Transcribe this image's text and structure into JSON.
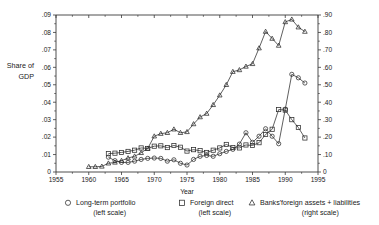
{
  "chart_data": {
    "type": "line",
    "title": "",
    "xlabel": "Year",
    "ylabel": "Share of GDP",
    "ylabel_line1": "Share of",
    "ylabel_line2": "GDP",
    "xlim": [
      1955,
      1995
    ],
    "xticks": [
      1955,
      1960,
      1965,
      1970,
      1975,
      1980,
      1985,
      1990,
      1995
    ],
    "xticklabels": [
      "1955",
      "1960",
      "1965",
      "1970",
      "1975",
      "1980",
      "1985",
      "1990",
      "1995"
    ],
    "ylim_left": [
      0,
      0.09
    ],
    "yticks_left": [
      0,
      0.01,
      0.02,
      0.03,
      0.04,
      0.05,
      0.06,
      0.07,
      0.08,
      0.09
    ],
    "yticklabels_left": [
      "0",
      ".01",
      ".02",
      ".03",
      ".04",
      ".05",
      ".06",
      ".07",
      ".08",
      ".09"
    ],
    "ylim_right": [
      0,
      90
    ],
    "yticks_right": [
      0,
      10,
      20,
      30,
      40,
      50,
      60,
      70,
      80,
      90
    ],
    "yticklabels_right": [
      "0",
      ".10",
      ".20",
      ".30",
      ".40",
      ".50",
      ".60",
      ".70",
      ".80",
      ".90"
    ],
    "grid": false,
    "legend_position": "below",
    "series": [
      {
        "name": "Long-term portfolio",
        "scale": "left",
        "marker": "circle",
        "x": [
          1963,
          1964,
          1965,
          1966,
          1967,
          1968,
          1969,
          1970,
          1971,
          1972,
          1973,
          1974,
          1975,
          1976,
          1977,
          1978,
          1979,
          1980,
          1981,
          1982,
          1983,
          1984,
          1985,
          1986,
          1987,
          1988,
          1989,
          1990,
          1991,
          1992,
          1993
        ],
        "values": [
          0.0085,
          0.0065,
          0.0055,
          0.0055,
          0.0062,
          0.0072,
          0.0078,
          0.008,
          0.0078,
          0.0062,
          0.007,
          0.005,
          0.004,
          0.0072,
          0.009,
          0.0095,
          0.009,
          0.0105,
          0.0118,
          0.013,
          0.016,
          0.0225,
          0.017,
          0.0205,
          0.0248,
          0.0205,
          0.0162,
          0.036,
          0.056,
          0.054,
          0.051
        ]
      },
      {
        "name": "Foreign direct",
        "scale": "left",
        "marker": "square",
        "x": [
          1963,
          1964,
          1965,
          1966,
          1967,
          1968,
          1969,
          1970,
          1971,
          1972,
          1973,
          1974,
          1975,
          1976,
          1977,
          1978,
          1979,
          1980,
          1981,
          1982,
          1983,
          1984,
          1985,
          1986,
          1987,
          1988,
          1989,
          1990,
          1991,
          1992,
          1993
        ],
        "values": [
          0.0105,
          0.0108,
          0.0112,
          0.0118,
          0.0125,
          0.0138,
          0.0135,
          0.0148,
          0.015,
          0.014,
          0.0152,
          0.0142,
          0.012,
          0.0128,
          0.0122,
          0.0112,
          0.0125,
          0.0138,
          0.0158,
          0.014,
          0.0138,
          0.0155,
          0.0152,
          0.0168,
          0.0215,
          0.0245,
          0.0358,
          0.0355,
          0.03,
          0.0255,
          0.0195
        ]
      },
      {
        "name": "Banks' foreign assets + liabilities",
        "scale": "right",
        "marker": "triangle",
        "x": [
          1960,
          1961,
          1962,
          1963,
          1964,
          1965,
          1966,
          1967,
          1968,
          1969,
          1970,
          1971,
          1972,
          1973,
          1974,
          1975,
          1976,
          1977,
          1978,
          1979,
          1980,
          1981,
          1982,
          1983,
          1984,
          1985,
          1986,
          1987,
          1988,
          1989,
          1990,
          1991,
          1992,
          1993
        ],
        "values": [
          3.0,
          3.0,
          3.2,
          5.0,
          5.5,
          6.5,
          8.0,
          9.0,
          11.0,
          13.5,
          20.5,
          22.0,
          22.5,
          24.5,
          22.5,
          23.0,
          27.5,
          31.5,
          33.5,
          38.5,
          44.0,
          50.0,
          57.5,
          58.5,
          60.5,
          62.0,
          71.0,
          80.5,
          76.5,
          72.5,
          86.0,
          87.5,
          83.0,
          80.5
        ]
      }
    ],
    "legend": [
      {
        "marker": "circle",
        "label": "Long-term portfolio",
        "sublabel": "(left scale)"
      },
      {
        "marker": "square",
        "label": "Foreign direct",
        "sublabel": "(left scale)"
      },
      {
        "marker": "triangle",
        "label": "Banks'foreign assets + liabilities",
        "sublabel": "(right scale)"
      }
    ],
    "colors": {
      "line": "#2b2b2b",
      "axis": "#3a3a3a",
      "text": "#1a1a1a",
      "background": "#ffffff"
    }
  }
}
